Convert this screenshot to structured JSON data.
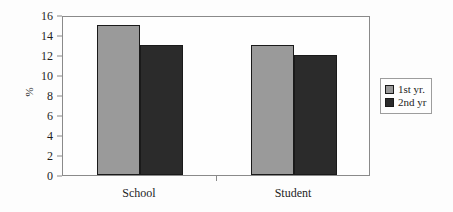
{
  "chart_data": {
    "type": "bar",
    "title": "",
    "subtitle": "",
    "xlabel": "",
    "ylabel": "%",
    "categories": [
      "School",
      "Student"
    ],
    "series": [
      {
        "name": "1st yr.",
        "values": [
          15,
          13
        ],
        "color": "#9a9a9a"
      },
      {
        "name": "2nd yr",
        "values": [
          13,
          12
        ],
        "color": "#2b2b2b"
      }
    ],
    "ylim": [
      0,
      16
    ],
    "yticks": [
      0,
      2,
      4,
      6,
      8,
      10,
      12,
      14,
      16
    ],
    "ytick_labels": [
      "0",
      "2",
      "4",
      "6",
      "8",
      "10",
      "12",
      "14",
      "16"
    ],
    "grid": false,
    "legend_position": "right",
    "frame": true
  },
  "legend": {
    "entries": [
      {
        "label": "1st yr.",
        "color": "#9a9a9a"
      },
      {
        "label": "2nd yr",
        "color": "#2b2b2b"
      }
    ]
  },
  "axes": {
    "y_label": "%",
    "y_tick_labels": [
      "16",
      "14",
      "12",
      "10",
      "8",
      "6",
      "4",
      "2",
      "0"
    ],
    "x_tick_labels": [
      "School",
      "Student"
    ]
  }
}
